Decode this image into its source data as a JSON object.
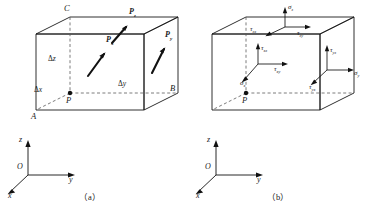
{
  "figure": {
    "caption_a": "（a）",
    "caption_b": "（b）",
    "stroke_color": "#1a1a1a",
    "dashed_color": "#5a5a5a"
  },
  "panel_a": {
    "vertices": [
      {
        "name": "vertex-c",
        "label": "C"
      },
      {
        "name": "vertex-a",
        "label": "A"
      },
      {
        "name": "vertex-b",
        "label": "B"
      },
      {
        "name": "point-p",
        "label": "P"
      }
    ],
    "dimensions": [
      {
        "name": "delta-z",
        "symbol": "Δ",
        "axis": "z"
      },
      {
        "name": "delta-x",
        "symbol": "Δ",
        "axis": "x"
      },
      {
        "name": "delta-y",
        "symbol": "Δ",
        "axis": "y"
      }
    ],
    "vectors": [
      {
        "name": "traction-pz",
        "symbol": "P",
        "sub": "z"
      },
      {
        "name": "traction-px",
        "symbol": "P",
        "sub": "x"
      },
      {
        "name": "traction-py",
        "symbol": "P",
        "sub": "y"
      }
    ],
    "axes": {
      "z": "z",
      "y": "y",
      "x": "x",
      "origin": "O"
    }
  },
  "panel_b": {
    "point_label": "P",
    "axes": {
      "z": "z",
      "y": "y",
      "x": "x",
      "origin": "O"
    },
    "top_face": [
      {
        "name": "sigma-z",
        "symbol": "σ",
        "sub": "z"
      },
      {
        "name": "tau-zx",
        "symbol": "τ",
        "sub": "zx"
      },
      {
        "name": "tau-zy",
        "symbol": "τ",
        "sub": "zy"
      }
    ],
    "front_face": [
      {
        "name": "tau-xz",
        "symbol": "τ",
        "sub": "xz"
      },
      {
        "name": "tau-xy",
        "symbol": "τ",
        "sub": "xy"
      },
      {
        "name": "sigma-x",
        "symbol": "σ",
        "sub": "x"
      }
    ],
    "right_face": [
      {
        "name": "tau-yz",
        "symbol": "τ",
        "sub": "yz"
      },
      {
        "name": "sigma-y",
        "symbol": "σ",
        "sub": "y"
      },
      {
        "name": "tau-yx",
        "symbol": "τ",
        "sub": "yx"
      }
    ]
  }
}
